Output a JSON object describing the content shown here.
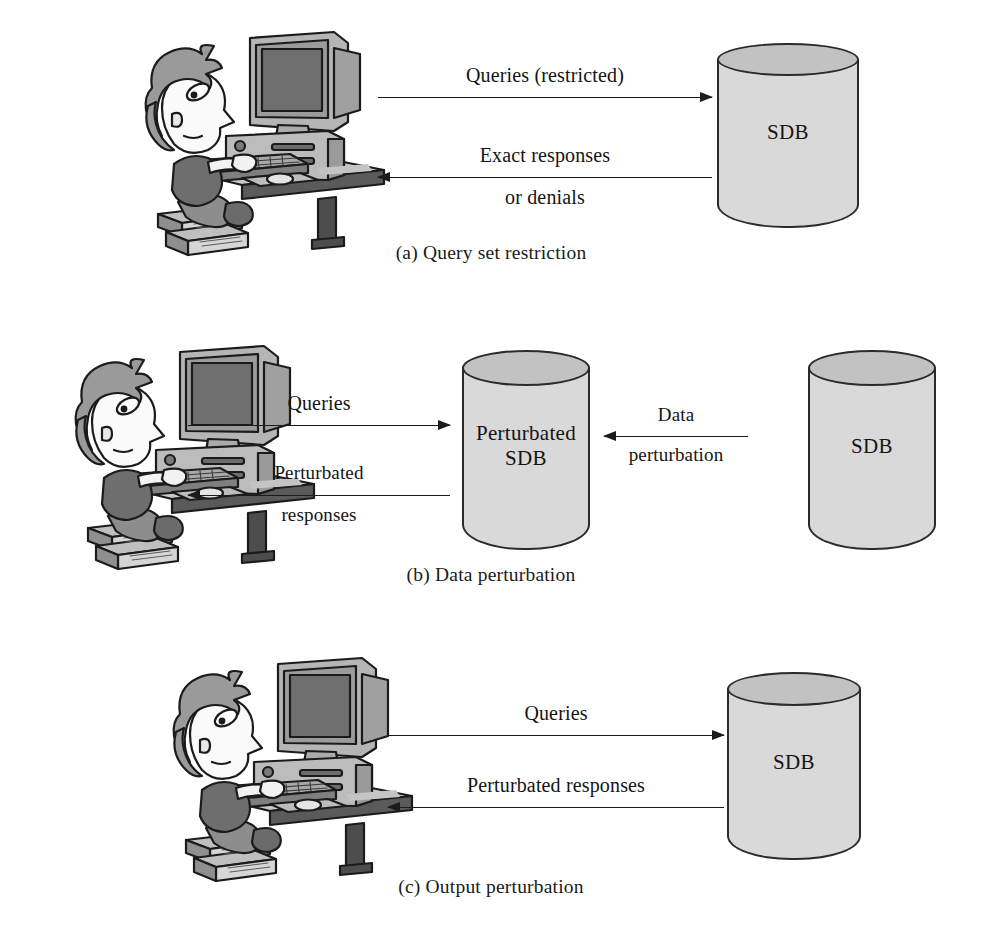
{
  "figure": {
    "background_color": "#ffffff",
    "line_color": "#1b1b1b",
    "db_body_color": "#d9d9d9",
    "db_top_color": "#c2c2c2"
  },
  "panels": [
    {
      "id": "a",
      "caption": "(a) Query set restriction",
      "user_label": "user-at-computer",
      "arrows": [
        {
          "direction": "right",
          "label_line1": "Queries (restricted)",
          "label_line2": ""
        },
        {
          "direction": "left",
          "label_line1": "Exact responses",
          "label_line2": "or denials"
        }
      ],
      "databases": [
        {
          "name": "sdb",
          "label_line1": "SDB",
          "label_line2": ""
        }
      ]
    },
    {
      "id": "b",
      "caption": "(b) Data perturbation",
      "user_label": "user-at-computer",
      "arrows": [
        {
          "direction": "right",
          "label_line1": "Queries",
          "label_line2": ""
        },
        {
          "direction": "left",
          "label_line1": "Perturbated",
          "label_line2": "responses"
        },
        {
          "direction": "left",
          "label_line1": "Data",
          "label_line2": "perturbation"
        }
      ],
      "databases": [
        {
          "name": "perturbated-sdb",
          "label_line1": "Perturbated",
          "label_line2": "SDB"
        },
        {
          "name": "sdb",
          "label_line1": "SDB",
          "label_line2": ""
        }
      ]
    },
    {
      "id": "c",
      "caption": "(c) Output perturbation",
      "user_label": "user-at-computer",
      "arrows": [
        {
          "direction": "right",
          "label_line1": "Queries",
          "label_line2": ""
        },
        {
          "direction": "left",
          "label_line1": "Perturbated responses",
          "label_line2": ""
        }
      ],
      "databases": [
        {
          "name": "sdb",
          "label_line1": "SDB",
          "label_line2": ""
        }
      ]
    }
  ]
}
